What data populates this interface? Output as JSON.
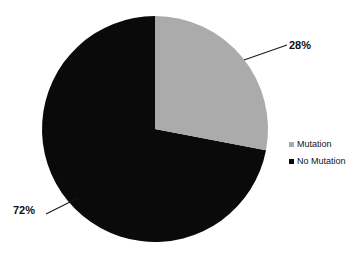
{
  "chart_data": {
    "type": "pie",
    "title": "",
    "subtitle": "",
    "xlabel": "",
    "ylabel": "",
    "categories": [
      "Mutation",
      "No Mutation"
    ],
    "values": [
      28,
      72
    ],
    "unit": "%",
    "data_labels": [
      "28%",
      "72%"
    ],
    "colors": [
      "#ababab",
      "#0a0a0a"
    ],
    "legend_position": "right",
    "grid": false,
    "start_angle_deg": 0,
    "direction": "clockwise",
    "slices": [
      {
        "label": "Mutation",
        "value": 28,
        "display": "28%",
        "color": "#ababab",
        "start_angle_deg": 0,
        "end_angle_deg": 100.8,
        "leader_line": true
      },
      {
        "label": "No Mutation",
        "value": 72,
        "display": "72%",
        "color": "#0a0a0a",
        "start_angle_deg": 100.8,
        "end_angle_deg": 360,
        "leader_line": true
      }
    ]
  },
  "geometry": {
    "center_x": 155,
    "center_y": 129,
    "radius": 113
  },
  "labels": {
    "mutation_pct": "28%",
    "no_mutation_pct": "72%"
  },
  "legend": {
    "items": [
      {
        "label": "Mutation",
        "color": "#ababab"
      },
      {
        "label": "No Mutation",
        "color": "#0a0a0a"
      }
    ]
  },
  "colors": {
    "background": "#ffffff",
    "mutation": "#ababab",
    "no_mutation": "#0a0a0a",
    "text": "#111111",
    "leader_line": "#1a1a1a"
  }
}
